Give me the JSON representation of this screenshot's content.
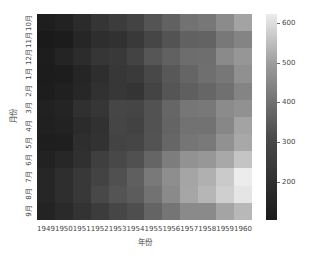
{
  "chart_data": {
    "type": "heatmap",
    "title": "",
    "xlabel": "年份",
    "ylabel": "月份",
    "x": [
      "1949",
      "1950",
      "1951",
      "1952",
      "1953",
      "1954",
      "1955",
      "1956",
      "1957",
      "1958",
      "1959",
      "1960"
    ],
    "y": [
      "10月",
      "11月",
      "12月",
      "1月",
      "2月",
      "3月",
      "4月",
      "5月",
      "6月",
      "7月",
      "8月",
      "9月"
    ],
    "values": [
      [
        119,
        133,
        162,
        191,
        211,
        229,
        274,
        306,
        347,
        359,
        407,
        461
      ],
      [
        104,
        114,
        146,
        172,
        180,
        203,
        237,
        271,
        305,
        310,
        362,
        390
      ],
      [
        118,
        140,
        166,
        194,
        201,
        229,
        278,
        306,
        336,
        337,
        405,
        432
      ],
      [
        112,
        115,
        145,
        171,
        196,
        204,
        242,
        284,
        315,
        340,
        360,
        417
      ],
      [
        118,
        126,
        150,
        180,
        196,
        188,
        233,
        277,
        301,
        318,
        342,
        391
      ],
      [
        132,
        141,
        178,
        193,
        236,
        235,
        267,
        317,
        356,
        362,
        406,
        419
      ],
      [
        129,
        135,
        163,
        181,
        235,
        227,
        269,
        313,
        348,
        348,
        396,
        461
      ],
      [
        121,
        125,
        172,
        183,
        229,
        234,
        270,
        318,
        355,
        363,
        420,
        472
      ],
      [
        135,
        149,
        178,
        218,
        243,
        264,
        315,
        374,
        422,
        435,
        472,
        535
      ],
      [
        148,
        170,
        199,
        230,
        264,
        302,
        364,
        413,
        465,
        491,
        548,
        622
      ],
      [
        148,
        170,
        199,
        242,
        272,
        293,
        347,
        405,
        467,
        505,
        559,
        606
      ],
      [
        136,
        158,
        184,
        209,
        237,
        259,
        312,
        355,
        404,
        404,
        463,
        508
      ]
    ],
    "colorbar": {
      "ticks": [
        200,
        300,
        400,
        500,
        600
      ],
      "range": [
        104,
        622
      ],
      "colormap": [
        "#1a1a1a",
        "#ececec"
      ]
    }
  }
}
